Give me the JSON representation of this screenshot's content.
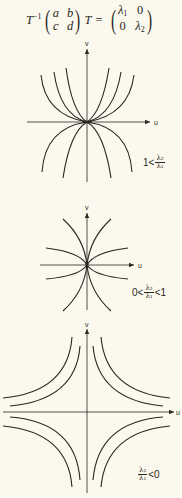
{
  "equation": {
    "lhs_matrix_prefix": "T",
    "inverse_sup": "−1",
    "matrix_abcd": [
      "a",
      "b",
      "c",
      "d"
    ],
    "rhs_matrix_suffix": "T",
    "equals": "=",
    "diag_matrix": [
      "λ",
      "0",
      "0",
      "λ"
    ],
    "diag_subscripts": [
      "1",
      "2"
    ]
  },
  "axes": {
    "horizontal_label": "u",
    "vertical_label": "v"
  },
  "panels": [
    {
      "id": "node-unequal",
      "condition_prefix": "1<",
      "fraction_num": "λ₂",
      "fraction_den": "λ₁",
      "condition_suffix": ""
    },
    {
      "id": "node-between",
      "condition_prefix": "0<",
      "fraction_num": "λ₂",
      "fraction_den": "λ₁",
      "condition_suffix": "<1"
    },
    {
      "id": "saddle",
      "condition_prefix": "",
      "fraction_num": "λ₂",
      "fraction_den": "λ₁",
      "condition_suffix": "<0"
    }
  ],
  "colors": {
    "background": "#fbf8ee",
    "ink": "#2a2622"
  }
}
